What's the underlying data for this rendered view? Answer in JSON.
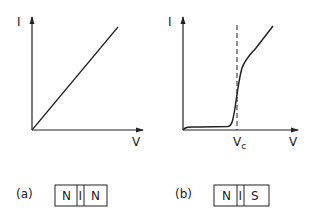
{
  "panels": [
    {
      "id": "a",
      "caption": "(a)",
      "y_axis_label": "I",
      "x_axis_label": "V",
      "curve": "linear",
      "junction": [
        "N",
        "I",
        "N"
      ]
    },
    {
      "id": "b",
      "caption": "(b)",
      "y_axis_label": "I",
      "x_axis_label": "V",
      "critical_label": "Vc",
      "curve": "nonlinear-threshold",
      "junction": [
        "N",
        "I",
        "S"
      ]
    }
  ],
  "colors": {
    "ink": "#222222",
    "background": "#ffffff"
  }
}
